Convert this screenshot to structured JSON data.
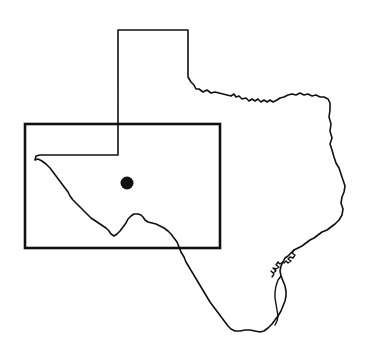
{
  "figure": {
    "title": "Texas state outline map",
    "description": "Outline map of the state of Texas with a rectangular study-area box over West Texas and a single filled circular site marker inside the box.",
    "width": 369,
    "height": 362,
    "background_color": "#ffffff",
    "line_color": "#111111"
  },
  "state": {
    "name": "Texas",
    "outline_label": "texas-state-boundary",
    "stroke_color": "#111111",
    "fill_color": "#ffffff",
    "stroke_width": 1.6,
    "path": "M118,30 L188,30 L188,77 L191,82 L194,85 L196,89 L199,89 L203,92 L207,90 L211,93 L215,92 L219,93 L223,94 L227,95 L231,96 L234,94 L236,97 L239,96 L242,99 L246,98 L249,101 L252,99 L255,101 L258,99 L261,102 L264,100 L267,102 L270,100 L273,102 L277,100 L280,98 L284,97 L288,95 L292,94 L296,95 L300,93 L304,95 L308,94 L312,96 L316,95 L320,97 L324,97 L328,99 L330,103 L330,110 L329,117 L331,124 L330,131 L332,138 L330,144 L332,150 L334,157 L336,163 L339,168 L341,174 L343,180 L345,186 L344,192 L342,197 L341,203 L343,209 L342,215 L339,220 L335,224 L331,227 L327,230 L322,232 L318,235 L314,238 L310,240 L306,243 L302,246 L298,248 L294,250 L291,253 L288,256 L285,258 L283,262 L281,266 L280,271 L281,276 L283,281 L285,286 L286,291 L286,296 L285,301 L283,306 L281,311 L278,316 L275,320 L272,324 L268,328 L264,331 L260,332 L255,331 L250,330 L245,330 L240,331 L235,331 L231,329 L228,326 L225,322 L222,318 L219,314 L216,310 L213,306 L210,302 L207,297 L204,292 L201,287 L198,282 L195,277 L192,272 L189,267 L186,262 L184,257 L181,252 L179,247 L177,242 L174,238 L171,234 L168,231 L164,228 L160,226 L156,224 L152,223 L148,222 L145,220 L143,217 L141,215 L138,214 L134,214 L131,216 L128,219 L126,223 L123,227 L120,231 L117,234 L114,236 L111,234 L109,231 L106,228 L103,226 L100,224 L97,222 L94,220 L91,218 L88,215 L85,212 L82,209 L79,206 L76,203 L73,200 L70,196 L68,192 L65,188 L62,184 L59,180 L56,176 L53,172 L50,168 L46,164 L42,161 L38,159 L35,160 L36,156 L40,155 L118,155 Z"
  },
  "coast_details": [
    {
      "label": "galveston-bay-inlet",
      "path": "M294,250 L292,253 L295,255 L293,258 L290,257 L288,259 L291,261 L288,263 L286,261 L284,263"
    },
    {
      "label": "matagorda-corpus-bays",
      "path": "M283,262 L280,264 L278,262 L276,265 L279,267 L276,269 L273,268 L276,271 L273,273 L271,271 L274,274 L272,277"
    },
    {
      "label": "padre-island-laguna-madre",
      "path": "M281,276 L278,280 L276,286 L275,292 L275,298 L276,304 L277,310 L278,316 L277,321 L275,325"
    }
  ],
  "region_box": {
    "label": "study-area-rectangle",
    "stroke_color": "#111111",
    "stroke_width": 2.6,
    "x": 25,
    "y": 124,
    "width": 195,
    "height": 124
  },
  "site_marker": {
    "label": "site-location-dot",
    "fill_color": "#111111",
    "cx": 127,
    "cy": 183,
    "r": 6.5
  }
}
